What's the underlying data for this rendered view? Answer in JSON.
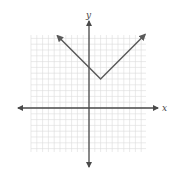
{
  "chart_data": {
    "type": "line",
    "title": "",
    "xlabel": "x",
    "ylabel": "y",
    "function": "y = |x - 2| + 5",
    "xlim": [
      -10,
      10
    ],
    "ylim": [
      -8,
      13
    ],
    "grid": true,
    "tick_labels": false,
    "series": [
      {
        "name": "absolute value graph",
        "points": [
          [
            -5.5,
            12.5
          ],
          [
            2,
            5
          ],
          [
            9.7,
            12.7
          ]
        ],
        "vertex": [
          2,
          5
        ],
        "arrows": "both ends"
      }
    ]
  },
  "colors": {
    "grid": "#dcdcdc",
    "axis": "#4a4a4a",
    "line": "#5a5a5a",
    "background": "#ffffff"
  }
}
